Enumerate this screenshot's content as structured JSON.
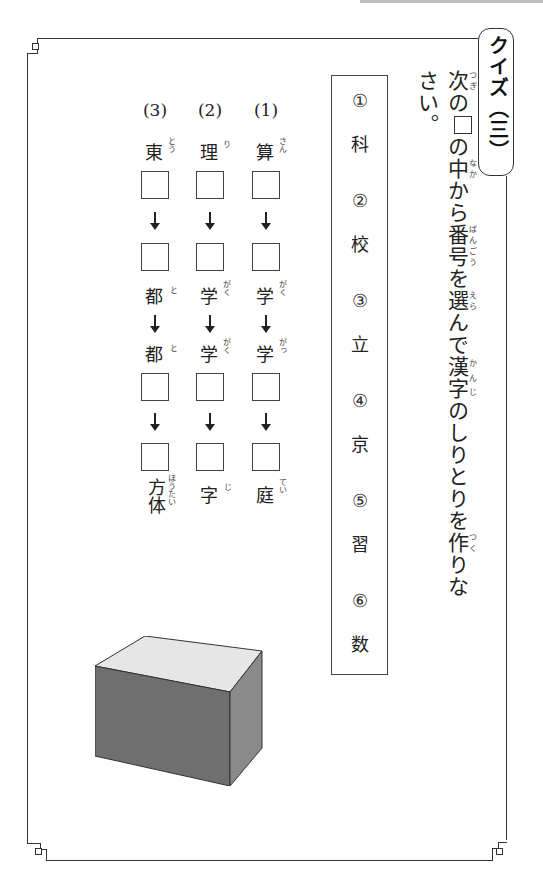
{
  "header": {
    "badge_text": "クイズ（三）"
  },
  "instruction": {
    "segments": [
      {
        "text": "次",
        "ruby": "つぎ"
      },
      {
        "text": "の"
      },
      {
        "box": true
      },
      {
        "text": "の"
      },
      {
        "text": "中",
        "ruby": "なか"
      },
      {
        "text": "から"
      },
      {
        "text": "番号",
        "ruby": "ばんごう"
      },
      {
        "text": "を"
      },
      {
        "text": "選",
        "ruby": "えら"
      },
      {
        "text": "んで"
      },
      {
        "text": "漢字",
        "ruby": "かんじ"
      },
      {
        "text": "のしりとりを"
      },
      {
        "text": "作",
        "ruby": "つく"
      },
      {
        "text": "りなさい。"
      }
    ]
  },
  "options": [
    {
      "number": "①",
      "kanji": "科"
    },
    {
      "number": "②",
      "kanji": "校"
    },
    {
      "number": "③",
      "kanji": "立"
    },
    {
      "number": "④",
      "kanji": "京"
    },
    {
      "number": "⑤",
      "kanji": "習"
    },
    {
      "number": "⑥",
      "kanji": "数"
    }
  ],
  "questions": [
    {
      "label": "(1)",
      "start": {
        "kanji": "算",
        "ruby": "さん"
      },
      "mid1": {
        "kanji": "学",
        "ruby": "がく"
      },
      "mid2": {
        "kanji": "学",
        "ruby": "がっ"
      },
      "end": {
        "kanji": "庭",
        "ruby": "てい"
      }
    },
    {
      "label": "(2)",
      "start": {
        "kanji": "理",
        "ruby": "り"
      },
      "mid1": {
        "kanji": "学",
        "ruby": "がく"
      },
      "mid2": {
        "kanji": "学",
        "ruby": "がく"
      },
      "end": {
        "kanji": "字",
        "ruby": "じ"
      }
    },
    {
      "label": "(3)",
      "start": {
        "kanji": "東",
        "ruby": "とう"
      },
      "mid1": {
        "kanji": "都",
        "ruby": "と"
      },
      "mid2": {
        "kanji": "都",
        "ruby": "と"
      },
      "end": {
        "kanji": "方体",
        "ruby": "ほうたい"
      }
    }
  ],
  "illustration": {
    "name": "cube",
    "colors": {
      "top": "#e6e6e6",
      "front": "#6f6f6f",
      "side": "#8a8a8a",
      "edge": "#333333"
    }
  }
}
